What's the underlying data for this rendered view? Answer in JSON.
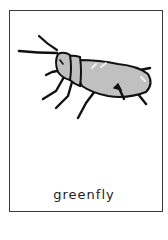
{
  "card": {
    "caption": "greenfly",
    "illustration": {
      "subject": "greenfly-insect",
      "colors": {
        "outline": "#111111",
        "body_fill": "#c0c0c0",
        "highlight": "#f2f2f2",
        "border": "#3a3a3a"
      }
    }
  }
}
